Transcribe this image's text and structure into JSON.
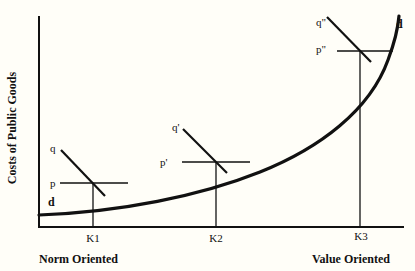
{
  "diagram": {
    "y_axis_label": "Costs of Public Goods",
    "x_axis_left_label": "Norm Oriented",
    "x_axis_right_label": "Value Oriented",
    "curve_label_left": "d",
    "curve_label_right": "d",
    "points": [
      {
        "k_label": "K1",
        "p_label": "p",
        "q_label": "q"
      },
      {
        "k_label": "K2",
        "p_label": "p'",
        "q_label": "q'"
      },
      {
        "k_label": "K3",
        "p_label": "p\"",
        "q_label": "q\""
      }
    ]
  }
}
